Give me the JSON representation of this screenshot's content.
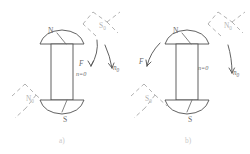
{
  "figure": {
    "panels": [
      {
        "id": "a",
        "caption": "a)",
        "magnet": {
          "top_pole_label": "N",
          "bottom_pole_label": "S"
        },
        "ghost_poles": [
          {
            "label": "S",
            "sub": "0",
            "position": "top-right"
          },
          {
            "label": "N",
            "sub": "0",
            "position": "bottom-left"
          }
        ],
        "annotations": [
          {
            "name": "force-label",
            "text": "F"
          },
          {
            "name": "normal-zero-label",
            "text": "n=0"
          },
          {
            "name": "normal-initial-label",
            "text": "n",
            "sub": "0"
          }
        ]
      },
      {
        "id": "b",
        "caption": "b)",
        "magnet": {
          "top_pole_label": "N",
          "bottom_pole_label": "S"
        },
        "ghost_poles": [
          {
            "label": "N",
            "sub": "0",
            "position": "top-right"
          },
          {
            "label": "S",
            "sub": "0",
            "position": "bottom-left"
          }
        ],
        "annotations": [
          {
            "name": "force-label",
            "text": "F"
          },
          {
            "name": "normal-zero-label",
            "text": "n=0"
          },
          {
            "name": "normal-initial-label",
            "text": "n",
            "sub": "0"
          }
        ]
      }
    ],
    "colors": {
      "line": "#4f4f4f",
      "dashed": "#a8a8a8",
      "label": "#6a6a6a",
      "ghost_label": "#b2b2b2",
      "caption": "#c9c9c9",
      "background": "#ffffff"
    }
  }
}
